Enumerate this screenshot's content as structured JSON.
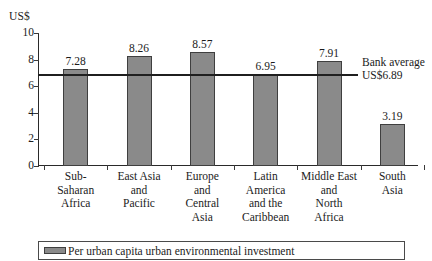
{
  "chart_data": {
    "type": "bar",
    "title": "",
    "subtitle": "",
    "xlabel": "",
    "ylabel": "US$",
    "ylim": [
      0,
      10
    ],
    "yticks": [
      0,
      2,
      4,
      6,
      8,
      10
    ],
    "ytick_labels": [
      "0",
      "2",
      "4",
      "6",
      "8",
      "10"
    ],
    "grid": false,
    "legend_position": "bottom",
    "categories": [
      "Sub-Saharan Africa",
      "East Asia and Pacific",
      "Europe and Central Asia",
      "Latin America and the Caribbean",
      "Middle East and North Africa",
      "South Asia"
    ],
    "category_label_lines": [
      [
        "Sub-",
        "Saharan",
        "Africa"
      ],
      [
        "East Asia",
        "and",
        "Pacific"
      ],
      [
        "Europe",
        "and",
        "Central",
        "Asia"
      ],
      [
        "Latin",
        "America",
        "and the",
        "Caribbean"
      ],
      [
        "Middle East",
        "and",
        "North",
        "Africa"
      ],
      [
        "South",
        "Asia"
      ]
    ],
    "values": [
      7.28,
      8.26,
      8.57,
      6.95,
      7.91,
      3.19
    ],
    "value_labels": [
      "7.28",
      "8.26",
      "8.57",
      "6.95",
      "7.91",
      "3.19"
    ],
    "series": [
      {
        "name": "Per urban capita urban environmental investment",
        "values": [
          7.28,
          8.26,
          8.57,
          6.95,
          7.91,
          3.19
        ],
        "color": "#8a8a8a"
      }
    ],
    "reference_line": {
      "value": 6.89,
      "label_lines": [
        "Bank average",
        "US$6.89"
      ],
      "color": "#1f1f1f"
    },
    "colors": {
      "bar_fill": "#8a8a8a",
      "bar_stroke": "#3f3f3f",
      "axis": "#2a2a2a",
      "text": "#1b1b1b",
      "reference_line": "#1f1f1f"
    }
  },
  "legend": {
    "items": [
      {
        "label": "Per urban capita urban environmental investment",
        "color": "#8a8a8a"
      }
    ]
  }
}
